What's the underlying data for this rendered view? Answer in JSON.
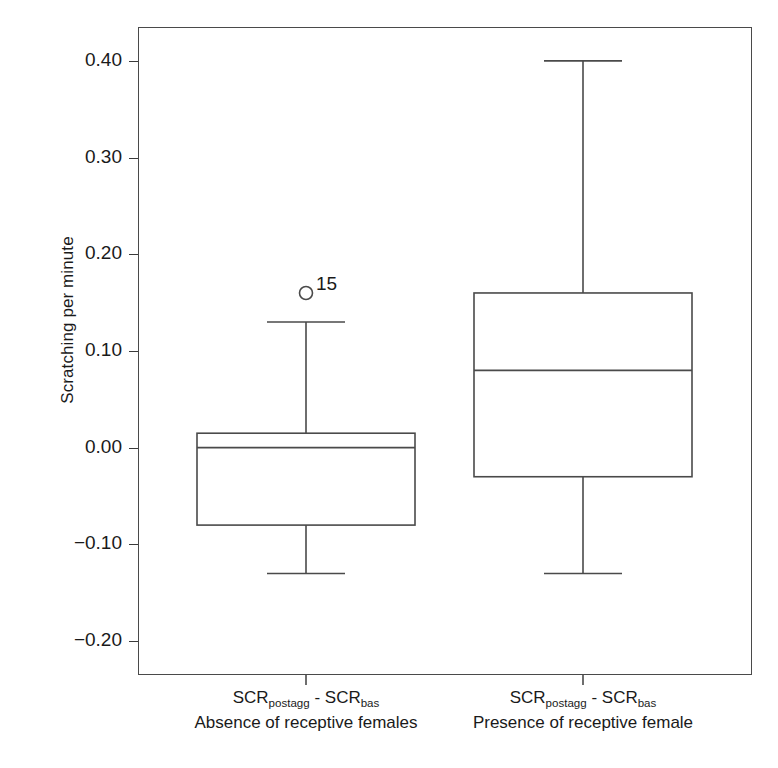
{
  "chart_data": {
    "type": "boxplot",
    "title": "",
    "xlabel": "",
    "ylabel": "Scratching per minute",
    "ylim": [
      -0.235,
      0.435
    ],
    "yticks": [
      0.4,
      0.3,
      0.2,
      0.1,
      0.0,
      -0.1,
      -0.2
    ],
    "ytick_labels": [
      "0.40",
      "0.30",
      "0.20",
      "0.10",
      "0.00",
      "-0.10",
      "-0.20"
    ],
    "grid": false,
    "legend": false,
    "categories": [
      "SCRpostagg - SCRbas / Absence of receptive females",
      "SCRpostagg - SCRbas / Presence of receptive female"
    ],
    "boxes": [
      {
        "name": "absence",
        "label_formula_prefix": "SCR",
        "label_formula_sub1": "postagg",
        "label_formula_mid": " - SCR",
        "label_formula_sub2": "bas",
        "caption": "Absence of receptive females",
        "whisker_low": -0.13,
        "q1": -0.08,
        "median": 0.0,
        "q3": 0.015,
        "whisker_high": 0.13,
        "outliers": [
          {
            "value": 0.16,
            "label": "15"
          }
        ]
      },
      {
        "name": "presence",
        "label_formula_prefix": "SCR",
        "label_formula_sub1": "postagg",
        "label_formula_mid": " - SCR",
        "label_formula_sub2": "bas",
        "caption": "Presence of receptive female",
        "whisker_low": -0.13,
        "q1": -0.03,
        "median": 0.08,
        "q3": 0.16,
        "whisker_high": 0.4,
        "outliers": []
      }
    ],
    "colors": {
      "line": "#4a4a4a",
      "text": "#1a1a1a",
      "background": "#ffffff"
    }
  }
}
